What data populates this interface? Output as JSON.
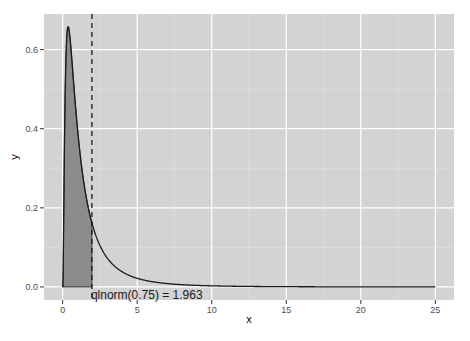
{
  "chart_data": {
    "type": "area",
    "title": "",
    "xlabel": "x",
    "ylabel": "y",
    "xlim": [
      -1.25,
      26.25
    ],
    "ylim": [
      -0.033,
      0.69
    ],
    "x_ticks": [
      0,
      5,
      10,
      15,
      20,
      25
    ],
    "x_tick_labels": [
      "0",
      "5",
      "10",
      "15",
      "20",
      "25"
    ],
    "y_ticks": [
      0.0,
      0.2,
      0.4,
      0.6
    ],
    "y_tick_labels": [
      "0.0",
      "0.2",
      "0.4",
      "0.6"
    ],
    "grid": true,
    "series": [
      {
        "name": "dlnorm(x)",
        "kind": "line",
        "distribution": "lognormal(meanlog=0, sdlog=1)",
        "x_range": [
          0,
          25
        ],
        "peak": {
          "x": 0.368,
          "y": 0.657
        }
      },
      {
        "name": "shaded area",
        "kind": "area",
        "x_range": [
          0,
          1.963
        ],
        "fill": "#7f7f7f"
      }
    ],
    "vline": {
      "x": 1.963,
      "style": "dashed"
    },
    "annotations": [
      {
        "text": "qlnorm(0.75) = 1.963",
        "x": 1.963,
        "y": 0.0
      }
    ]
  },
  "colors": {
    "panel_bg": "#d3d3d3",
    "grid_major": "#ffffff",
    "grid_minor": "#e3e3e3",
    "line": "#1a1a1a",
    "area_fill": "#8c8c8c"
  }
}
